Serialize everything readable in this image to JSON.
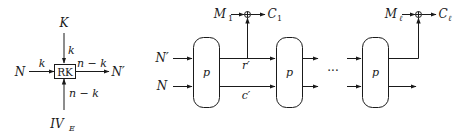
{
  "left_diagram": {
    "box_label": "RK",
    "top_input": {
      "label": "K",
      "edge_label": "k"
    },
    "left_input": {
      "label": "N",
      "edge_label": "k"
    },
    "right_output": {
      "label": "N′",
      "edge_label": "n − k"
    },
    "bottom_input": {
      "label": "IV",
      "subscript": "E",
      "edge_label": "n − k"
    }
  },
  "right_diagram": {
    "inputs": [
      {
        "label": "N′"
      },
      {
        "label": "N"
      }
    ],
    "blocks": [
      {
        "label": "p"
      },
      {
        "label": "p"
      },
      {
        "label": "p"
      }
    ],
    "wire_labels": {
      "top": "r′",
      "bottom": "c′"
    },
    "ellipsis": "···",
    "xor_stages": [
      {
        "message": "M",
        "message_sub": "1",
        "cipher": "C",
        "cipher_sub": "1"
      },
      {
        "message": "M",
        "message_sub": "ℓ",
        "cipher": "C",
        "cipher_sub": "ℓ"
      }
    ]
  }
}
